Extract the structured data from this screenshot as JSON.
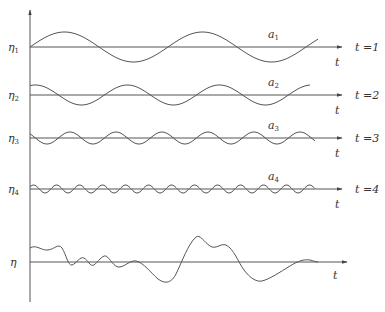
{
  "figure": {
    "rows": [
      {
        "eta_label": "η",
        "eta_sub": "1",
        "a_label": "a",
        "a_sub": "1",
        "t_label": "t",
        "time_label": "t =1",
        "baseline_y": 47,
        "amplitude": 15,
        "period": 138,
        "phase": 0
      },
      {
        "eta_label": "η",
        "eta_sub": "2",
        "a_label": "a",
        "a_sub": "2",
        "t_label": "t",
        "time_label": "t =2",
        "baseline_y": 95,
        "amplitude": 10,
        "period": 92,
        "phase": 1.2
      },
      {
        "eta_label": "η",
        "eta_sub": "3",
        "a_label": "a",
        "a_sub": "3",
        "t_label": "t",
        "time_label": "t =3",
        "baseline_y": 138,
        "amplitude": 6,
        "period": 46,
        "phase": 2.4
      },
      {
        "eta_label": "η",
        "eta_sub": "4",
        "a_label": "a",
        "a_sub": "4",
        "t_label": "t",
        "time_label": "t =4",
        "baseline_y": 189,
        "amplitude": 4,
        "period": 23,
        "phase": 0.6
      }
    ],
    "sum_row": {
      "eta_label": "η",
      "t_label": "t",
      "baseline_y": 262
    }
  }
}
